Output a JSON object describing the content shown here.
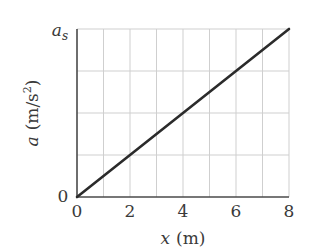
{
  "chart_data": {
    "type": "line",
    "title": "",
    "xlabel": "x (m)",
    "ylabel": "a (m/s^2)",
    "xlabel_var": "x",
    "xlabel_unit": "(m)",
    "ylabel_var": "a",
    "ylabel_unit_base": "(m/s",
    "ylabel_unit_exp": "2",
    "ylabel_unit_close": ")",
    "xlim": [
      0,
      8
    ],
    "ylim": [
      0,
      "a_s"
    ],
    "x_ticks": [
      "0",
      "2",
      "4",
      "6",
      "8"
    ],
    "y_ticks": [
      "0",
      "a_s"
    ],
    "y_tick_top_var": "a",
    "y_tick_top_sub": "s",
    "y_tick_bottom": "0",
    "grid": true,
    "grid_columns": 8,
    "grid_rows": 4,
    "legend": null,
    "series": [
      {
        "name": "a(x)",
        "x": [
          0,
          8
        ],
        "y": [
          0,
          "a_s"
        ],
        "y_fraction_of_as": [
          0,
          1
        ],
        "color": "#2b2b2b"
      }
    ]
  },
  "colors": {
    "line": "#2b2b2b",
    "axis": "#4a4a4a",
    "grid": "#cfcfcf",
    "text": "#3a3a3a"
  }
}
